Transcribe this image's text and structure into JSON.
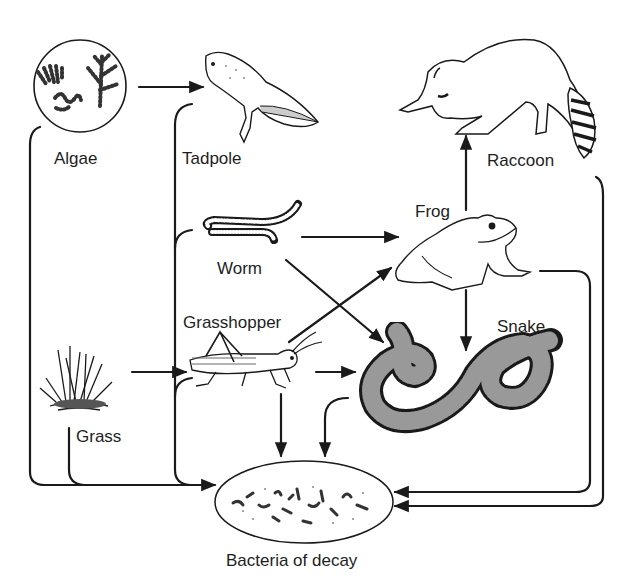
{
  "diagram": {
    "type": "food-web",
    "nodes": [
      {
        "id": "algae",
        "label": "Algae"
      },
      {
        "id": "tadpole",
        "label": "Tadpole"
      },
      {
        "id": "raccoon",
        "label": "Raccoon"
      },
      {
        "id": "worm",
        "label": "Worm"
      },
      {
        "id": "frog",
        "label": "Frog"
      },
      {
        "id": "grasshopper",
        "label": "Grasshopper"
      },
      {
        "id": "snake",
        "label": "Snake"
      },
      {
        "id": "grass",
        "label": "Grass"
      },
      {
        "id": "bacteria",
        "label": "Bacteria of decay"
      }
    ],
    "edges": [
      {
        "from": "algae",
        "to": "tadpole"
      },
      {
        "from": "worm",
        "to": "frog"
      },
      {
        "from": "worm",
        "to": "snake"
      },
      {
        "from": "grasshopper",
        "to": "frog"
      },
      {
        "from": "grasshopper",
        "to": "snake"
      },
      {
        "from": "grass",
        "to": "grasshopper"
      },
      {
        "from": "frog",
        "to": "raccoon"
      },
      {
        "from": "frog",
        "to": "snake"
      },
      {
        "from": "algae",
        "to": "bacteria"
      },
      {
        "from": "grass",
        "to": "bacteria"
      },
      {
        "from": "tadpole",
        "to": "bacteria"
      },
      {
        "from": "worm",
        "to": "bacteria"
      },
      {
        "from": "grasshopper",
        "to": "bacteria"
      },
      {
        "from": "snake",
        "to": "bacteria"
      },
      {
        "from": "frog",
        "to": "bacteria"
      },
      {
        "from": "raccoon",
        "to": "bacteria"
      }
    ],
    "colors": {
      "line": "#1a1a1a",
      "background": "#ffffff"
    }
  }
}
